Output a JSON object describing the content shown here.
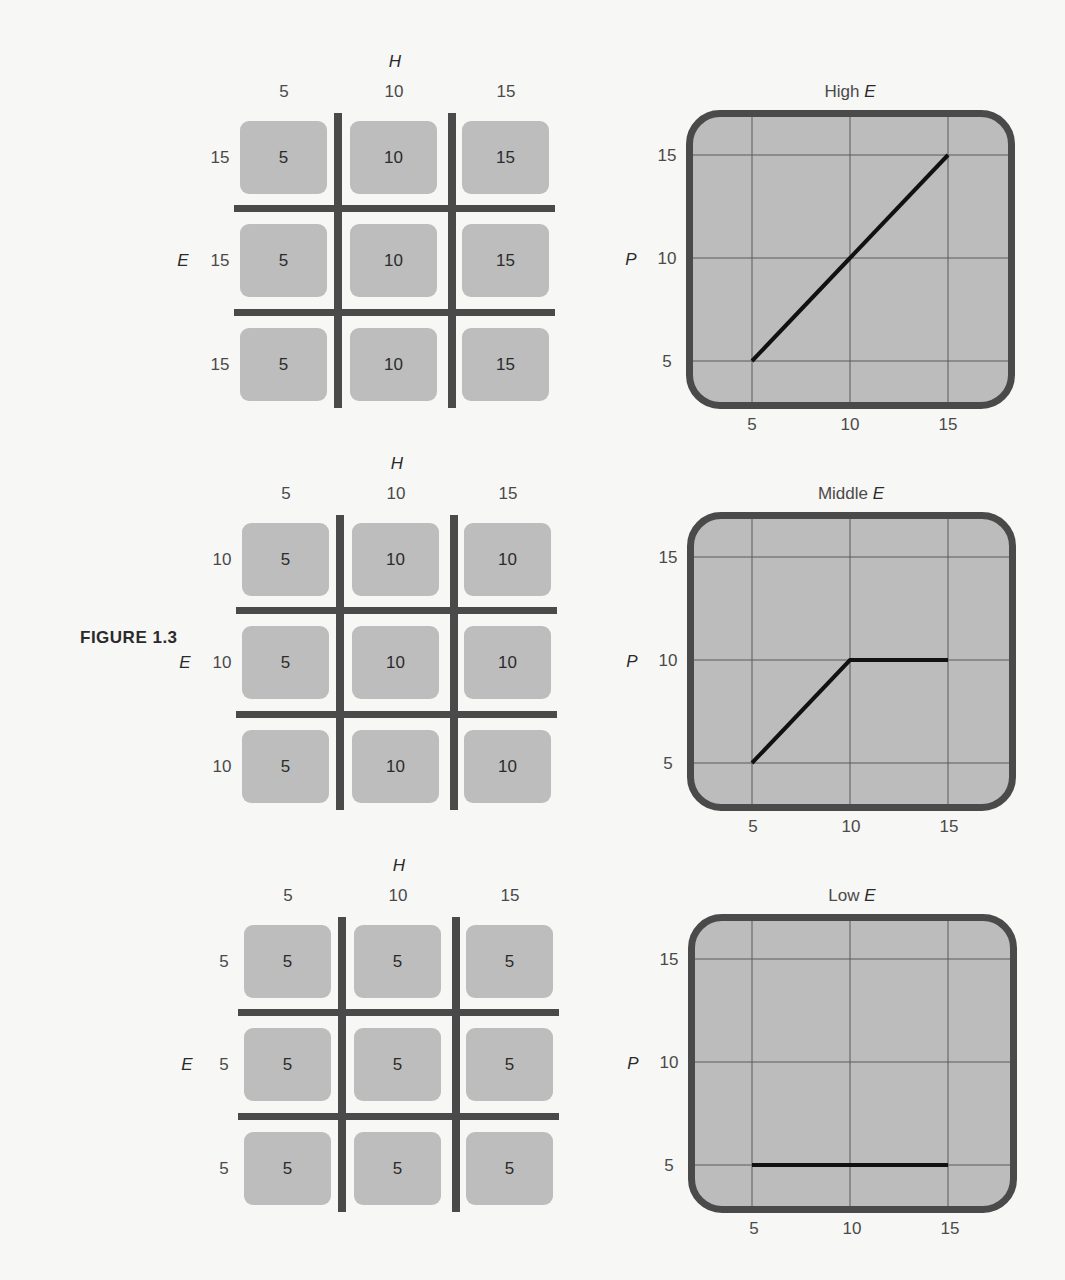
{
  "figure": {
    "label": "FIGURE 1.3"
  },
  "panels": [
    {
      "id": "high",
      "grid": {
        "h_axis_label": "H",
        "e_axis_label": "E",
        "col_labels": [
          "5",
          "10",
          "15"
        ],
        "row_labels": [
          "15",
          "15",
          "15"
        ],
        "cells": [
          [
            "5",
            "10",
            "15"
          ],
          [
            "5",
            "10",
            "15"
          ],
          [
            "5",
            "10",
            "15"
          ]
        ]
      },
      "chart": {
        "title_prefix": "High ",
        "title_var": "E",
        "y_axis_label": "P",
        "y_ticks": [
          "15",
          "10",
          "5"
        ],
        "x_ticks": [
          "5",
          "10",
          "15"
        ]
      }
    },
    {
      "id": "middle",
      "grid": {
        "h_axis_label": "H",
        "e_axis_label": "E",
        "col_labels": [
          "5",
          "10",
          "15"
        ],
        "row_labels": [
          "10",
          "10",
          "10"
        ],
        "cells": [
          [
            "5",
            "10",
            "10"
          ],
          [
            "5",
            "10",
            "10"
          ],
          [
            "5",
            "10",
            "10"
          ]
        ]
      },
      "chart": {
        "title_prefix": "Middle ",
        "title_var": "E",
        "y_axis_label": "P",
        "y_ticks": [
          "15",
          "10",
          "5"
        ],
        "x_ticks": [
          "5",
          "10",
          "15"
        ]
      }
    },
    {
      "id": "low",
      "grid": {
        "h_axis_label": "H",
        "e_axis_label": "E",
        "col_labels": [
          "5",
          "10",
          "15"
        ],
        "row_labels": [
          "5",
          "5",
          "5"
        ],
        "cells": [
          [
            "5",
            "5",
            "5"
          ],
          [
            "5",
            "5",
            "5"
          ],
          [
            "5",
            "5",
            "5"
          ]
        ]
      },
      "chart": {
        "title_prefix": "Low ",
        "title_var": "E",
        "y_axis_label": "P",
        "y_ticks": [
          "15",
          "10",
          "5"
        ],
        "x_ticks": [
          "5",
          "10",
          "15"
        ]
      }
    }
  ],
  "chart_data": [
    {
      "type": "line",
      "title": "High E",
      "xlabel": "H",
      "ylabel": "P",
      "x": [
        5,
        10,
        15
      ],
      "series": [
        {
          "name": "P",
          "values": [
            5,
            10,
            15
          ]
        }
      ],
      "xlim": [
        5,
        15
      ],
      "ylim": [
        5,
        15
      ],
      "grid": true
    },
    {
      "type": "line",
      "title": "Middle E",
      "xlabel": "H",
      "ylabel": "P",
      "x": [
        5,
        10,
        15
      ],
      "series": [
        {
          "name": "P",
          "values": [
            5,
            10,
            10
          ]
        }
      ],
      "xlim": [
        5,
        15
      ],
      "ylim": [
        5,
        15
      ],
      "grid": true
    },
    {
      "type": "line",
      "title": "Low E",
      "xlabel": "H",
      "ylabel": "P",
      "x": [
        5,
        10,
        15
      ],
      "series": [
        {
          "name": "P",
          "values": [
            5,
            5,
            5
          ]
        }
      ],
      "xlim": [
        5,
        15
      ],
      "ylim": [
        5,
        15
      ],
      "grid": true
    }
  ],
  "colors": {
    "cell": "#bdbdbd",
    "bar": "#4a4a4a",
    "chart_bg": "#bcbcbc",
    "line": "#111111",
    "gridline": "#5a5a5a"
  }
}
